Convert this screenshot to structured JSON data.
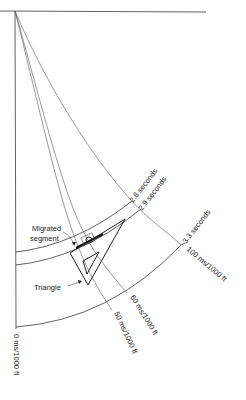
{
  "figure": {
    "labels": {
      "arc_2_8": "2.8 seconds",
      "arc_2_9": "2.9 seconds",
      "arc_3_3": "3.3 seconds",
      "radial_0": "0 ms/1000 ft",
      "radial_50": "50 ms/1000 ft",
      "radial_60": "60 ms/1000 ft",
      "radial_100": "100 ms/1000 ft",
      "migrated_line1": "Migrated",
      "migrated_line2": "segment",
      "triangle": "Triangle"
    },
    "colors": {
      "line": "#3a3a3a",
      "text": "#222222",
      "background": "#ffffff"
    }
  }
}
